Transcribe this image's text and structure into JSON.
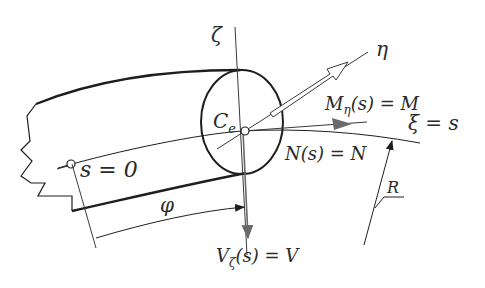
{
  "figure": {
    "colors": {
      "line": "#1e1e1e",
      "force_arrow": "#5a5a5a",
      "background": "#ffffff"
    }
  },
  "labels": {
    "zeta_axis": "ζ",
    "eta_axis": "η",
    "xi_axis": "ξ = s",
    "centroid": "C",
    "centroid_sub": "e",
    "moment": "M",
    "moment_sub": "η",
    "moment_rest": "(s) = M",
    "normal_force": "N(s) = N",
    "shear_force": "V",
    "shear_sub": "ζ",
    "shear_rest": "(s) = V",
    "origin": "s = 0",
    "angle": "φ",
    "radius": "R"
  }
}
